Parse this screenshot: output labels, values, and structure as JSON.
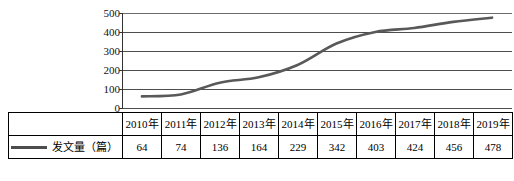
{
  "chart_data": {
    "type": "line",
    "title": "",
    "xlabel": "",
    "ylabel": "",
    "categories": [
      "2010年",
      "2011年",
      "2012年",
      "2013年",
      "2014年",
      "2015年",
      "2016年",
      "2017年",
      "2018年",
      "2019年"
    ],
    "series": [
      {
        "name": "发文量（篇）",
        "values": [
          64,
          74,
          136,
          164,
          229,
          342,
          403,
          424,
          456,
          478
        ],
        "color": "#595959"
      }
    ],
    "ylim": [
      0,
      500
    ],
    "yticks": [
      0,
      100,
      200,
      300,
      400,
      500
    ],
    "ytick_labels": [
      "0",
      "100",
      "200",
      "300",
      "400",
      "500"
    ],
    "grid": true,
    "grid_axis": "y",
    "legend_position": "table-row-header",
    "smoothing": "spline"
  },
  "table": {
    "year_header_row": [
      "2010年",
      "2011年",
      "2012年",
      "2013年",
      "2014年",
      "2015年",
      "2016年",
      "2017年",
      "2018年",
      "2019年"
    ],
    "series_label": "发文量（篇）",
    "values": [
      "64",
      "74",
      "136",
      "164",
      "229",
      "342",
      "403",
      "424",
      "456",
      "478"
    ]
  },
  "colors": {
    "line": "#595959",
    "gridline": "#4d4d4d",
    "axis": "#333333",
    "table_border": "#000000",
    "text": "#111111"
  }
}
